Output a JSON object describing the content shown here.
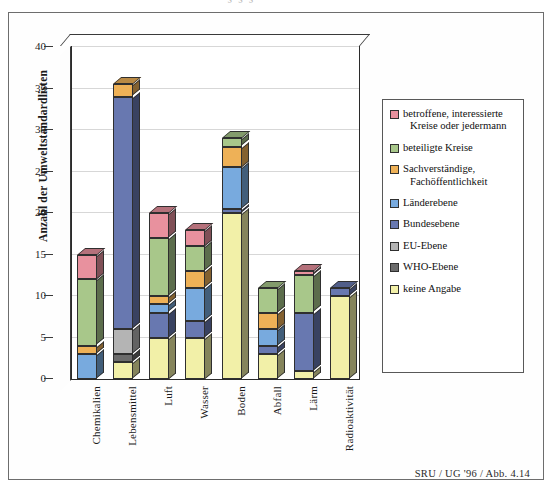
{
  "figure": {
    "footnote": "SRU / UG '96 / Abb. 4.14",
    "cropped_title_ghost": "’’ § § §"
  },
  "chart_data": {
    "type": "bar",
    "subtype": "stacked-bar-3d",
    "title": "",
    "xlabel": "",
    "ylabel": "Anzahl der Umweltstandardlisten",
    "ylim": [
      0,
      40
    ],
    "yticks": [
      0,
      5,
      10,
      15,
      20,
      25,
      30,
      35,
      40
    ],
    "ytick_labels": [
      "0",
      "5",
      "10",
      "15",
      "20",
      "25",
      "30",
      "35",
      "40"
    ],
    "grid": true,
    "legend_position": "right",
    "categories": [
      "Chemikalien",
      "Lebensmittel",
      "Luft",
      "Wasser",
      "Boden",
      "Abfall",
      "Lärm",
      "Radioaktivität"
    ],
    "series": [
      {
        "name": "keine Angabe",
        "color": "#f2f0a8",
        "values": [
          0,
          2,
          5,
          5,
          20,
          3,
          1,
          10
        ]
      },
      {
        "name": "WHO-Ebene",
        "color": "#6b6b6b",
        "values": [
          0,
          1,
          0,
          0,
          0,
          0,
          0,
          0
        ]
      },
      {
        "name": "EU-Ebene",
        "color": "#b4b4b4",
        "values": [
          0,
          3,
          0,
          0,
          0,
          0,
          0,
          0
        ]
      },
      {
        "name": "Bundesebene",
        "color": "#6878b0",
        "values": [
          0,
          28,
          3,
          2,
          0.5,
          1,
          7,
          1
        ]
      },
      {
        "name": "Länderebene",
        "color": "#78aade",
        "values": [
          3,
          0,
          1,
          4,
          5,
          2,
          0,
          0
        ]
      },
      {
        "name": "Sachverständige, Fachöffentlichkeit",
        "color": "#eeb157",
        "values": [
          1,
          1.5,
          1,
          2,
          2.5,
          2,
          0,
          0
        ]
      },
      {
        "name": "beteiligte Kreise",
        "color": "#a8c78a",
        "values": [
          8,
          0,
          7,
          3,
          1,
          3,
          4.5,
          0
        ]
      },
      {
        "name": "betroffene, interessierte Kreise oder jedermann",
        "color": "#e8919e",
        "values": [
          3,
          0,
          3,
          2,
          0,
          0,
          0.5,
          0
        ]
      }
    ],
    "totals": [
      15,
      35.5,
      20,
      18,
      29,
      11,
      13,
      11
    ]
  },
  "legend": {
    "items": [
      {
        "color": "#e8919e",
        "line1": "betroffene, interessierte",
        "line2": "Kreise oder jedermann"
      },
      {
        "color": "#a8c78a",
        "line1": "beteiligte Kreise",
        "line2": ""
      },
      {
        "color": "#eeb157",
        "line1": "Sachverständige,",
        "line2": "Fachöffentlichkeit"
      },
      {
        "color": "#78aade",
        "line1": "Länderebene",
        "line2": ""
      },
      {
        "color": "#6878b0",
        "line1": "Bundesebene",
        "line2": ""
      },
      {
        "color": "#b4b4b4",
        "line1": "EU-Ebene",
        "line2": ""
      },
      {
        "color": "#6b6b6b",
        "line1": "WHO-Ebene",
        "line2": ""
      },
      {
        "color": "#f2f0a8",
        "line1": "keine Angabe",
        "line2": ""
      }
    ]
  }
}
